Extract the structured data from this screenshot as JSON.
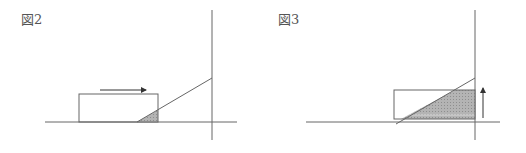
{
  "figures": [
    {
      "label": "図2",
      "description": "Rectangle moving right toward a sloped line; small shaded triangle overlap",
      "arrow_direction": "right"
    },
    {
      "label": "図3",
      "description": "Rectangle against vertical wall with large shaded trapezoid overlap",
      "arrow_direction": "up"
    }
  ],
  "colors": {
    "line": "#666666",
    "shade": "#aaaaaa",
    "background": "#ffffff"
  }
}
